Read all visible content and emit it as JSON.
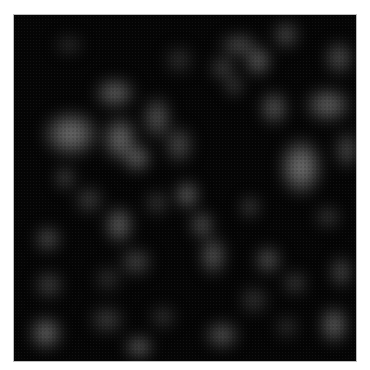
{
  "image": {
    "description": "Grayscale blurred blob texture on black background",
    "background": "#050505",
    "border": "#bdbdbd",
    "blobs": [
      {
        "x": 28,
        "y": 95,
        "w": 58,
        "h": 48,
        "l": 125
      },
      {
        "x": 80,
        "y": 62,
        "w": 42,
        "h": 32,
        "l": 110
      },
      {
        "x": 88,
        "y": 100,
        "w": 36,
        "h": 48,
        "l": 120
      },
      {
        "x": 108,
        "y": 128,
        "w": 30,
        "h": 30,
        "l": 115
      },
      {
        "x": 128,
        "y": 80,
        "w": 30,
        "h": 46,
        "l": 95
      },
      {
        "x": 150,
        "y": 110,
        "w": 30,
        "h": 40,
        "l": 85
      },
      {
        "x": 40,
        "y": 150,
        "w": 22,
        "h": 26,
        "l": 80
      },
      {
        "x": 60,
        "y": 170,
        "w": 30,
        "h": 30,
        "l": 70
      },
      {
        "x": 90,
        "y": 190,
        "w": 30,
        "h": 40,
        "l": 110
      },
      {
        "x": 105,
        "y": 232,
        "w": 34,
        "h": 30,
        "l": 80
      },
      {
        "x": 130,
        "y": 175,
        "w": 26,
        "h": 26,
        "l": 65
      },
      {
        "x": 205,
        "y": 18,
        "w": 40,
        "h": 24,
        "l": 90
      },
      {
        "x": 230,
        "y": 30,
        "w": 28,
        "h": 32,
        "l": 110
      },
      {
        "x": 258,
        "y": 5,
        "w": 28,
        "h": 30,
        "l": 85
      },
      {
        "x": 310,
        "y": 25,
        "w": 30,
        "h": 36,
        "l": 90
      },
      {
        "x": 210,
        "y": 60,
        "w": 20,
        "h": 22,
        "l": 80
      },
      {
        "x": 245,
        "y": 75,
        "w": 30,
        "h": 36,
        "l": 100
      },
      {
        "x": 290,
        "y": 72,
        "w": 48,
        "h": 36,
        "l": 110
      },
      {
        "x": 265,
        "y": 122,
        "w": 44,
        "h": 60,
        "l": 130
      },
      {
        "x": 320,
        "y": 115,
        "w": 26,
        "h": 40,
        "l": 85
      },
      {
        "x": 160,
        "y": 165,
        "w": 26,
        "h": 30,
        "l": 115
      },
      {
        "x": 175,
        "y": 195,
        "w": 26,
        "h": 30,
        "l": 95
      },
      {
        "x": 185,
        "y": 220,
        "w": 28,
        "h": 42,
        "l": 100
      },
      {
        "x": 195,
        "y": 40,
        "w": 28,
        "h": 26,
        "l": 75
      },
      {
        "x": 225,
        "y": 180,
        "w": 22,
        "h": 24,
        "l": 75
      },
      {
        "x": 240,
        "y": 230,
        "w": 28,
        "h": 30,
        "l": 95
      },
      {
        "x": 268,
        "y": 255,
        "w": 26,
        "h": 26,
        "l": 70
      },
      {
        "x": 300,
        "y": 190,
        "w": 28,
        "h": 24,
        "l": 65
      },
      {
        "x": 315,
        "y": 240,
        "w": 24,
        "h": 34,
        "l": 85
      },
      {
        "x": 20,
        "y": 210,
        "w": 28,
        "h": 28,
        "l": 90
      },
      {
        "x": 20,
        "y": 255,
        "w": 30,
        "h": 30,
        "l": 75
      },
      {
        "x": 15,
        "y": 300,
        "w": 34,
        "h": 36,
        "l": 115
      },
      {
        "x": 75,
        "y": 290,
        "w": 36,
        "h": 30,
        "l": 70
      },
      {
        "x": 80,
        "y": 250,
        "w": 28,
        "h": 28,
        "l": 55
      },
      {
        "x": 110,
        "y": 320,
        "w": 30,
        "h": 24,
        "l": 110
      },
      {
        "x": 190,
        "y": 305,
        "w": 36,
        "h": 30,
        "l": 95
      },
      {
        "x": 135,
        "y": 290,
        "w": 28,
        "h": 24,
        "l": 60
      },
      {
        "x": 225,
        "y": 270,
        "w": 30,
        "h": 30,
        "l": 60
      },
      {
        "x": 305,
        "y": 290,
        "w": 30,
        "h": 40,
        "l": 110
      },
      {
        "x": 260,
        "y": 300,
        "w": 26,
        "h": 24,
        "l": 55
      },
      {
        "x": 40,
        "y": 20,
        "w": 30,
        "h": 20,
        "l": 55
      },
      {
        "x": 150,
        "y": 30,
        "w": 30,
        "h": 30,
        "l": 55
      }
    ]
  }
}
